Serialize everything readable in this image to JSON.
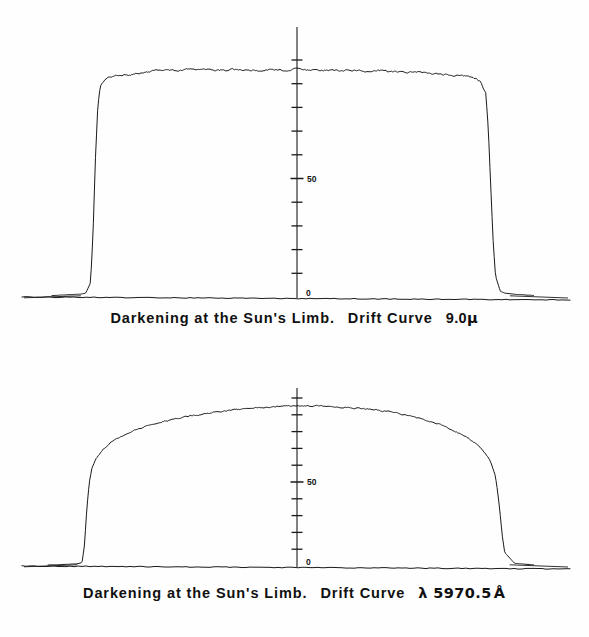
{
  "figure": {
    "background_color": "#fefefe",
    "ink_color": "#1a1a1a"
  },
  "panels": [
    {
      "id": "top",
      "caption_prefix": "Darkening at the Sun's Limb.",
      "caption_middle": "Drift Curve",
      "caption_value": "9.0",
      "caption_unit": "μ",
      "axis_labels": {
        "upper": "50",
        "lower": "0"
      }
    },
    {
      "id": "bottom",
      "caption_prefix": "Darkening at the Sun's Limb.",
      "caption_middle": "Drift Curve",
      "caption_value": "λ 5970.5",
      "caption_unit": "Å",
      "axis_labels": {
        "upper": "50",
        "lower": "0"
      }
    }
  ],
  "chart_data": [
    {
      "type": "line",
      "title": "Darkening at the Sun's Limb. Drift Curve 9.0μ",
      "xlabel": "",
      "ylabel": "",
      "ylim": [
        0,
        100
      ],
      "xlim": [
        0,
        100
      ],
      "grid": false,
      "legend": null,
      "annotations": [
        "50",
        "0"
      ],
      "tick_values": [
        0,
        10,
        20,
        30,
        40,
        50,
        60,
        70,
        80,
        90,
        100
      ],
      "labeled_ticks": {
        "50": "50",
        "0": "0"
      },
      "description": "Solar limb darkening drift curve at 9.0 micron wavelength; nearly flat-topped profile with very steep limb edges, indicating minimal limb darkening in the far infrared.",
      "x": [
        0,
        2,
        4,
        6,
        7,
        8,
        8.5,
        9,
        9.5,
        10,
        11,
        12,
        14,
        16,
        18,
        20,
        22,
        24,
        26,
        28,
        30,
        32,
        34,
        36,
        38,
        40,
        42,
        44,
        46,
        48,
        50,
        52,
        54,
        56,
        58,
        60,
        62,
        64,
        66,
        68,
        70,
        72,
        74,
        76,
        78,
        80,
        82,
        84,
        86,
        88,
        89,
        90,
        90.5,
        91,
        91.5,
        92,
        93,
        94,
        96,
        98,
        100
      ],
      "y": [
        0.6,
        0.8,
        1.0,
        1.2,
        1.6,
        6.0,
        26.0,
        58.0,
        80.0,
        88.5,
        91.5,
        92.6,
        93.4,
        93.9,
        94.4,
        94.9,
        95.4,
        95.9,
        95.6,
        95.8,
        96.0,
        95.6,
        95.8,
        95.6,
        95.9,
        95.6,
        95.8,
        95.5,
        96.1,
        95.7,
        96.3,
        95.8,
        96.0,
        95.6,
        95.8,
        95.5,
        95.7,
        95.2,
        95.4,
        95.6,
        95.0,
        95.2,
        94.8,
        94.9,
        94.5,
        94.2,
        93.9,
        93.5,
        93.0,
        92.0,
        90.5,
        86.0,
        72.0,
        48.0,
        24.0,
        9.0,
        2.4,
        1.6,
        1.2,
        0.9,
        0.6
      ],
      "noise_amplitude": 0.55
    },
    {
      "type": "line",
      "title": "Darkening at the Sun's Limb. Drift Curve λ 5970.5 Å",
      "xlabel": "",
      "ylabel": "",
      "ylim": [
        0,
        100
      ],
      "xlim": [
        0,
        100
      ],
      "grid": false,
      "legend": null,
      "annotations": [
        "50",
        "0"
      ],
      "tick_values": [
        0,
        10,
        20,
        30,
        40,
        50,
        60,
        70,
        80,
        90,
        100
      ],
      "labeled_ticks": {
        "50": "50",
        "0": "0"
      },
      "description": "Solar limb darkening drift curve at visible wavelength 5970.5 Angstrom; strongly rounded dome-shaped profile showing pronounced limb darkening toward both limbs.",
      "x": [
        0,
        2,
        4,
        6,
        7,
        7.5,
        8,
        8.5,
        9,
        10,
        11,
        12,
        13,
        14,
        16,
        18,
        20,
        22,
        24,
        26,
        28,
        30,
        32,
        34,
        36,
        38,
        40,
        42,
        44,
        46,
        48,
        50,
        52,
        54,
        56,
        58,
        60,
        62,
        64,
        66,
        68,
        70,
        72,
        74,
        76,
        78,
        80,
        82,
        84,
        86,
        88,
        90,
        91,
        92,
        92.5,
        93,
        93.5,
        94,
        96,
        98,
        100
      ],
      "y": [
        0.6,
        0.8,
        1.0,
        1.3,
        2.0,
        12.0,
        34.0,
        50.0,
        58.0,
        64.0,
        68.0,
        71.0,
        73.5,
        75.5,
        78.5,
        81.0,
        83.0,
        84.8,
        86.3,
        87.6,
        88.8,
        89.8,
        90.7,
        91.5,
        92.2,
        92.8,
        93.4,
        93.9,
        94.3,
        94.7,
        95.0,
        95.2,
        95.3,
        95.3,
        95.2,
        95.0,
        94.8,
        94.4,
        94.0,
        93.4,
        92.7,
        91.9,
        90.9,
        89.7,
        88.3,
        86.7,
        84.8,
        82.6,
        80.0,
        76.8,
        72.8,
        67.0,
        62.5,
        54.0,
        45.0,
        32.0,
        18.0,
        8.0,
        1.6,
        1.1,
        0.7
      ],
      "noise_amplitude": 0.6
    }
  ]
}
